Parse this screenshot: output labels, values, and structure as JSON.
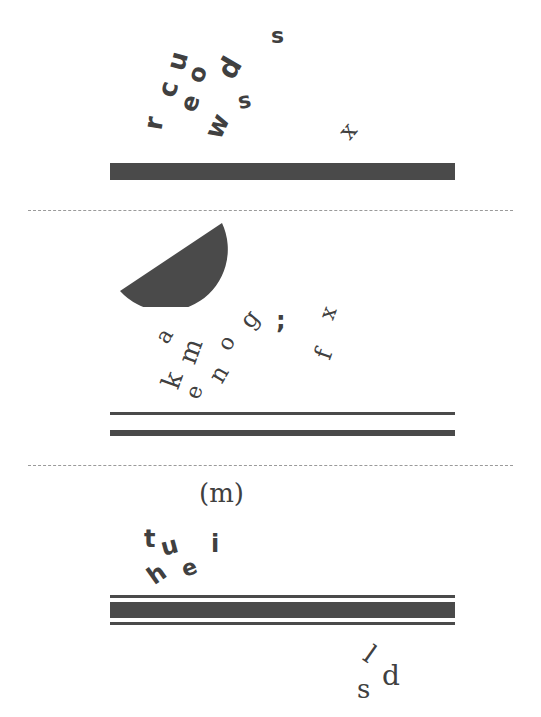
{
  "panels": [
    {
      "id": "panel-1",
      "glyphs": [
        {
          "char": "r",
          "x": 147,
          "y": 110,
          "size": 26,
          "rotate": -80,
          "style": "sans"
        },
        {
          "char": "c",
          "x": 160,
          "y": 76,
          "size": 26,
          "rotate": -75,
          "style": "sans"
        },
        {
          "char": "u",
          "x": 168,
          "y": 48,
          "size": 26,
          "rotate": -75,
          "style": "sans"
        },
        {
          "char": "e",
          "x": 182,
          "y": 91,
          "size": 24,
          "rotate": -70,
          "style": "sans"
        },
        {
          "char": "o",
          "x": 189,
          "y": 62,
          "size": 24,
          "rotate": -70,
          "style": "sans"
        },
        {
          "char": "d",
          "x": 220,
          "y": 54,
          "size": 28,
          "rotate": -60,
          "style": "sans"
        },
        {
          "char": "w",
          "x": 205,
          "y": 113,
          "size": 26,
          "rotate": -65,
          "style": "sans"
        },
        {
          "char": "s",
          "x": 238,
          "y": 90,
          "size": 22,
          "rotate": -10,
          "style": "sans"
        },
        {
          "char": "s",
          "x": 271,
          "y": 25,
          "size": 22,
          "rotate": 0,
          "style": "sans"
        },
        {
          "char": "x",
          "x": 341,
          "y": 119,
          "size": 24,
          "rotate": -50,
          "style": "serif"
        }
      ],
      "bars": [
        {
          "x": 110,
          "y": 163,
          "w": 345,
          "h": 17
        }
      ]
    },
    {
      "id": "panel-2",
      "shape": {
        "type": "half-disc",
        "x": 118,
        "y": 221,
        "w": 112,
        "h": 86
      },
      "glyphs": [
        {
          "char": "a",
          "x": 158,
          "y": 325,
          "size": 22,
          "rotate": -60,
          "style": "serif"
        },
        {
          "char": "k",
          "x": 164,
          "y": 367,
          "size": 26,
          "rotate": -70,
          "style": "serif"
        },
        {
          "char": "m",
          "x": 178,
          "y": 338,
          "size": 26,
          "rotate": -70,
          "style": "serif"
        },
        {
          "char": "e",
          "x": 188,
          "y": 381,
          "size": 22,
          "rotate": -70,
          "style": "serif"
        },
        {
          "char": "n",
          "x": 211,
          "y": 362,
          "size": 24,
          "rotate": -60,
          "style": "serif"
        },
        {
          "char": "o",
          "x": 220,
          "y": 332,
          "size": 22,
          "rotate": -60,
          "style": "serif"
        },
        {
          "char": "g",
          "x": 242,
          "y": 307,
          "size": 24,
          "rotate": -50,
          "style": "serif"
        },
        {
          "char": ";",
          "x": 276,
          "y": 309,
          "size": 24,
          "rotate": 0,
          "style": "sans"
        },
        {
          "char": "x",
          "x": 322,
          "y": 302,
          "size": 22,
          "rotate": -70,
          "style": "serif"
        },
        {
          "char": "f",
          "x": 319,
          "y": 342,
          "size": 24,
          "rotate": -70,
          "style": "serif"
        }
      ],
      "bars": [
        {
          "x": 110,
          "y": 412,
          "w": 345,
          "h": 3
        },
        {
          "x": 110,
          "y": 430,
          "w": 345,
          "h": 6
        }
      ]
    },
    {
      "id": "panel-3",
      "glyphs": [
        {
          "char": "(m)",
          "x": 199,
          "y": 480,
          "size": 26,
          "rotate": 0,
          "style": "serif"
        },
        {
          "char": "t",
          "x": 144,
          "y": 527,
          "size": 24,
          "rotate": 0,
          "style": "sans"
        },
        {
          "char": "u",
          "x": 161,
          "y": 534,
          "size": 24,
          "rotate": -15,
          "style": "sans"
        },
        {
          "char": "i",
          "x": 211,
          "y": 532,
          "size": 24,
          "rotate": 0,
          "style": "sans"
        },
        {
          "char": "h",
          "x": 148,
          "y": 562,
          "size": 24,
          "rotate": -35,
          "style": "sans"
        },
        {
          "char": "e",
          "x": 182,
          "y": 557,
          "size": 22,
          "rotate": -20,
          "style": "sans"
        }
      ],
      "bars": [
        {
          "x": 110,
          "y": 595,
          "w": 345,
          "h": 3
        },
        {
          "x": 110,
          "y": 602,
          "w": 345,
          "h": 16
        },
        {
          "x": 110,
          "y": 622,
          "w": 345,
          "h": 3
        }
      ]
    },
    {
      "id": "panel-footer",
      "glyphs": [
        {
          "char": "s",
          "x": 357,
          "y": 676,
          "size": 26,
          "rotate": 0,
          "style": "serif"
        },
        {
          "char": "l",
          "x": 366,
          "y": 641,
          "size": 26,
          "rotate": 35,
          "style": "serif"
        },
        {
          "char": "d",
          "x": 382,
          "y": 662,
          "size": 28,
          "rotate": 0,
          "style": "serif"
        }
      ],
      "bars": []
    }
  ],
  "dividers": [
    {
      "x": 28,
      "y": 210,
      "w": 485
    },
    {
      "x": 28,
      "y": 465,
      "w": 485
    }
  ],
  "colors": {
    "ink": "#404040",
    "bar": "#4a4a4a",
    "divider": "#9a9a9a",
    "background": "#ffffff"
  }
}
